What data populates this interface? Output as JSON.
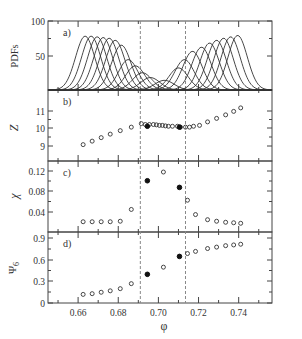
{
  "figure": {
    "xlabel": "φ",
    "x_ticks": [
      "0.66",
      "0.68",
      "0.70",
      "0.72",
      "0.74"
    ],
    "x_tick_values": [
      0.66,
      0.68,
      0.7,
      0.72,
      0.74
    ],
    "xlim": [
      0.645,
      0.7566
    ],
    "dashed_lines_x": [
      0.691,
      0.7135
    ]
  },
  "chart_data": [
    {
      "panel": "a)",
      "type": "line",
      "ylabel": "PDFs",
      "y_ticks": [
        "50",
        "100"
      ],
      "ylim": [
        0,
        100
      ],
      "series_description": "Family of Gaussian-like probability distribution functions; peaks decrease toward the central region and rise again on the right",
      "peaks": [
        {
          "center": 0.6635,
          "height": 78
        },
        {
          "center": 0.6665,
          "height": 78
        },
        {
          "center": 0.6695,
          "height": 77
        },
        {
          "center": 0.6725,
          "height": 76
        },
        {
          "center": 0.6755,
          "height": 75
        },
        {
          "center": 0.6785,
          "height": 72
        },
        {
          "center": 0.6815,
          "height": 65
        },
        {
          "center": 0.685,
          "height": 44
        },
        {
          "center": 0.6885,
          "height": 35
        },
        {
          "center": 0.692,
          "height": 25
        },
        {
          "center": 0.696,
          "height": 18
        },
        {
          "center": 0.703,
          "height": 14
        },
        {
          "center": 0.71,
          "height": 32
        },
        {
          "center": 0.713,
          "height": 44
        },
        {
          "center": 0.717,
          "height": 56
        },
        {
          "center": 0.7215,
          "height": 62
        },
        {
          "center": 0.7255,
          "height": 68
        },
        {
          "center": 0.729,
          "height": 72
        },
        {
          "center": 0.7325,
          "height": 75
        },
        {
          "center": 0.736,
          "height": 77
        },
        {
          "center": 0.7395,
          "height": 79
        }
      ]
    },
    {
      "panel": "b)",
      "type": "scatter",
      "ylabel": "Z",
      "y_ticks": [
        "9",
        "10",
        "11"
      ],
      "ylim": [
        8.15,
        12.05
      ],
      "series": [
        {
          "name": "open",
          "x": [
            0.6625,
            0.667,
            0.6715,
            0.676,
            0.681,
            0.6865,
            0.6915,
            0.6935,
            0.6955,
            0.6975,
            0.699,
            0.7005,
            0.702,
            0.7035,
            0.705,
            0.707,
            0.7095,
            0.711,
            0.7135,
            0.7155,
            0.7175,
            0.7205,
            0.7245,
            0.729,
            0.7335,
            0.7375,
            0.741
          ],
          "y": [
            9.05,
            9.25,
            9.45,
            9.65,
            9.85,
            10.05,
            10.25,
            10.2,
            10.2,
            10.2,
            10.18,
            10.15,
            10.15,
            10.12,
            10.1,
            10.1,
            10.1,
            10.05,
            10.05,
            10.05,
            10.1,
            10.15,
            10.35,
            10.55,
            10.75,
            10.95,
            11.15
          ]
        },
        {
          "name": "filled",
          "x": [
            0.6945,
            0.7105
          ],
          "y": [
            10.1,
            10.05
          ]
        }
      ]
    },
    {
      "panel": "c)",
      "type": "scatter",
      "ylabel": "χ",
      "y_ticks": [
        "0.04",
        "0.08",
        "0.12"
      ],
      "ylim": [
        0.0,
        0.14
      ],
      "series": [
        {
          "name": "open",
          "x": [
            0.6625,
            0.667,
            0.6715,
            0.676,
            0.681,
            0.6865,
            0.7025,
            0.7145,
            0.7185,
            0.7245,
            0.729,
            0.7335,
            0.7375,
            0.741
          ],
          "y": [
            0.021,
            0.021,
            0.021,
            0.021,
            0.022,
            0.045,
            0.118,
            0.063,
            0.035,
            0.025,
            0.022,
            0.02,
            0.019,
            0.018
          ]
        },
        {
          "name": "filled",
          "x": [
            0.6945,
            0.7105
          ],
          "y": [
            0.101,
            0.088
          ]
        }
      ]
    },
    {
      "panel": "d)",
      "type": "scatter",
      "ylabel": "Ψ6",
      "y_ticks": [
        "0",
        "0.3",
        "0.6",
        "0.9"
      ],
      "ylim": [
        0,
        0.98
      ],
      "series": [
        {
          "name": "open",
          "x": [
            0.6625,
            0.667,
            0.6715,
            0.676,
            0.681,
            0.6865,
            0.7025,
            0.7145,
            0.7185,
            0.7245,
            0.729,
            0.7335,
            0.7375,
            0.741
          ],
          "y": [
            0.12,
            0.13,
            0.15,
            0.17,
            0.2,
            0.27,
            0.5,
            0.69,
            0.72,
            0.76,
            0.78,
            0.8,
            0.81,
            0.82
          ]
        },
        {
          "name": "filled",
          "x": [
            0.6945,
            0.7105
          ],
          "y": [
            0.4,
            0.65
          ]
        }
      ]
    }
  ]
}
